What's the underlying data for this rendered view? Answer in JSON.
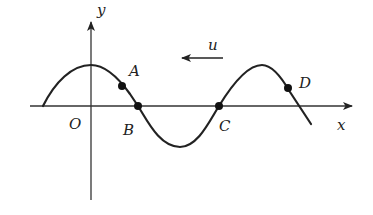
{
  "diagram": {
    "type": "transverse wave snapshot",
    "axes": {
      "x_label": "x",
      "y_label": "y",
      "origin_label": "O"
    },
    "velocity": {
      "label": "u",
      "direction": "left"
    },
    "points": [
      {
        "label": "A",
        "position": "on descending slope, above axis"
      },
      {
        "label": "B",
        "position": "on x-axis (zero crossing)"
      },
      {
        "label": "C",
        "position": "on x-axis (zero crossing)"
      },
      {
        "label": "D",
        "position": "on descending slope after second crest, above axis"
      }
    ],
    "colors": {
      "stroke": "#222222",
      "background": "#ffffff"
    }
  }
}
